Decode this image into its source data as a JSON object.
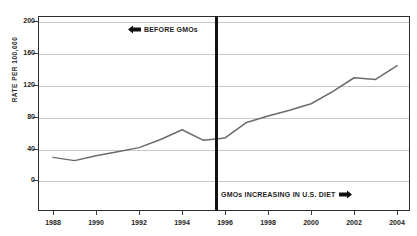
{
  "chart_data": {
    "type": "line",
    "title": "1988 - 2004",
    "xlabel": "",
    "ylabel": "RATE PER 100,000",
    "xlim": [
      1987.3,
      2004.6
    ],
    "ylim": [
      -28,
      212
    ],
    "grid": true,
    "legend_position": "none",
    "series": [
      {
        "name": "Rate per 100,000",
        "color": "#6b6b6b",
        "x": [
          1988,
          1989,
          1990,
          1991,
          1992,
          1993,
          1994,
          1995,
          1996,
          1997,
          1998,
          1999,
          2000,
          2001,
          2002,
          2003,
          2004
        ],
        "values": [
          38,
          34,
          40,
          45,
          50,
          60,
          72,
          59,
          62,
          81,
          89,
          96,
          104,
          119,
          136,
          134,
          151
        ]
      }
    ],
    "ytick_labels": [
      "200",
      "160",
      "120",
      "80",
      "40",
      "0"
    ],
    "ytick_values": [
      200,
      160,
      120,
      80,
      40,
      0
    ],
    "xtick_labels": [
      "1988",
      "1990",
      "1992",
      "1994",
      "1996",
      "1998",
      "2000",
      "2002",
      "2004"
    ],
    "xtick_values": [
      1988,
      1990,
      1992,
      1994,
      1996,
      1998,
      2000,
      2002,
      2004
    ],
    "annotations": [
      {
        "name": "before-gmos",
        "label": "BEFORE GMOs",
        "icon": "arrow-left-icon",
        "x": 1995.6,
        "position": "top-left-of-divider"
      },
      {
        "name": "gmos-increasing",
        "label": "GMOs INCREASING IN U.S. DIET",
        "icon": "arrow-right-icon",
        "x": 1995.6,
        "position": "bottom-right-of-divider"
      }
    ],
    "reference_line": {
      "name": "gmo-introduction-divider",
      "x": 1995.6,
      "color": "#111111"
    }
  }
}
